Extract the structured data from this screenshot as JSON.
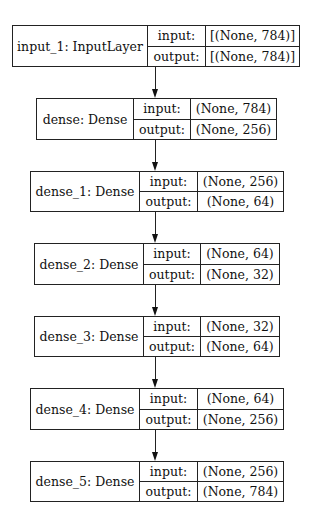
{
  "diagram": {
    "type": "keras-model-plot",
    "port_labels": {
      "input": "input:",
      "output": "output:"
    },
    "nodes": [
      {
        "label": "input_1: InputLayer",
        "input": "[(None, 784)]",
        "output": "[(None, 784)]"
      },
      {
        "label": "dense: Dense",
        "input": "(None, 784)",
        "output": "(None, 256)"
      },
      {
        "label": "dense_1: Dense",
        "input": "(None, 256)",
        "output": "(None, 64)"
      },
      {
        "label": "dense_2: Dense",
        "input": "(None, 64)",
        "output": "(None, 32)"
      },
      {
        "label": "dense_3: Dense",
        "input": "(None, 32)",
        "output": "(None, 64)"
      },
      {
        "label": "dense_4: Dense",
        "input": "(None, 64)",
        "output": "(None, 256)"
      },
      {
        "label": "dense_5: Dense",
        "input": "(None, 256)",
        "output": "(None, 784)"
      }
    ],
    "edges": [
      {
        "from": "input_1",
        "to": "dense"
      },
      {
        "from": "dense",
        "to": "dense_1"
      },
      {
        "from": "dense_1",
        "to": "dense_2"
      },
      {
        "from": "dense_2",
        "to": "dense_3"
      },
      {
        "from": "dense_3",
        "to": "dense_4"
      },
      {
        "from": "dense_4",
        "to": "dense_5"
      }
    ]
  }
}
